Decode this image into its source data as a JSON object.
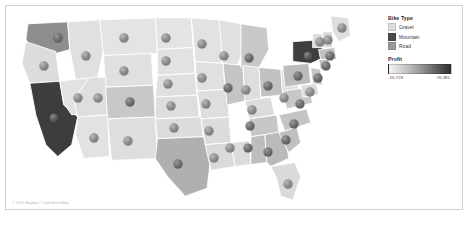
{
  "chart_data": {
    "type": "map",
    "title": "",
    "subtitle": "",
    "map_region": "United States",
    "marker_encoding": "Profit (circle markers per state)",
    "fill_encoding": "Bike Type",
    "legend_position": "top-right",
    "categories": [
      "Gravel",
      "Mountain",
      "Road"
    ],
    "category_colors": [
      "#dcdcdc",
      "#4a4a4a",
      "#9a9a9a"
    ],
    "profit_range": [
      -25729,
      76381
    ],
    "profit_labels": [
      "-25,729",
      "76,381"
    ],
    "states": [
      {
        "name": "Washington",
        "bike_type": "Road",
        "x": 52,
        "y": 32,
        "fill": "#8e8e8e"
      },
      {
        "name": "Oregon",
        "bike_type": "Gravel",
        "x": 38,
        "y": 60,
        "fill": "#dcdcdc"
      },
      {
        "name": "California",
        "bike_type": "Mountain",
        "x": 48,
        "y": 112,
        "fill": "#3d3d3d"
      },
      {
        "name": "Nevada",
        "bike_type": "Gravel",
        "x": 72,
        "y": 92,
        "fill": "#e2e2e2"
      },
      {
        "name": "Idaho",
        "bike_type": "Gravel",
        "x": 80,
        "y": 50,
        "fill": "#e0e0e0"
      },
      {
        "name": "Montana",
        "bike_type": "Gravel",
        "x": 118,
        "y": 32,
        "fill": "#e4e4e4"
      },
      {
        "name": "Wyoming",
        "bike_type": "Gravel",
        "x": 118,
        "y": 65,
        "fill": "#e0e0e0"
      },
      {
        "name": "Utah",
        "bike_type": "Gravel",
        "x": 92,
        "y": 92,
        "fill": "#dedede"
      },
      {
        "name": "Arizona",
        "bike_type": "Gravel",
        "x": 88,
        "y": 132,
        "fill": "#e2e2e2"
      },
      {
        "name": "Colorado",
        "bike_type": "Road",
        "x": 124,
        "y": 96,
        "fill": "#c8c8c8"
      },
      {
        "name": "New Mexico",
        "bike_type": "Gravel",
        "x": 122,
        "y": 135,
        "fill": "#dedede"
      },
      {
        "name": "North Dakota",
        "bike_type": "Gravel",
        "x": 160,
        "y": 32,
        "fill": "#e4e4e4"
      },
      {
        "name": "South Dakota",
        "bike_type": "Gravel",
        "x": 160,
        "y": 55,
        "fill": "#e2e2e2"
      },
      {
        "name": "Nebraska",
        "bike_type": "Gravel",
        "x": 162,
        "y": 78,
        "fill": "#e0e0e0"
      },
      {
        "name": "Kansas",
        "bike_type": "Gravel",
        "x": 165,
        "y": 100,
        "fill": "#dedede"
      },
      {
        "name": "Oklahoma",
        "bike_type": "Gravel",
        "x": 168,
        "y": 122,
        "fill": "#dcdcdc"
      },
      {
        "name": "Texas",
        "bike_type": "Road",
        "x": 172,
        "y": 158,
        "fill": "#b0b0b0"
      },
      {
        "name": "Minnesota",
        "bike_type": "Gravel",
        "x": 196,
        "y": 38,
        "fill": "#e2e2e2"
      },
      {
        "name": "Iowa",
        "bike_type": "Gravel",
        "x": 196,
        "y": 72,
        "fill": "#e0e0e0"
      },
      {
        "name": "Missouri",
        "bike_type": "Gravel",
        "x": 200,
        "y": 98,
        "fill": "#dedede"
      },
      {
        "name": "Arkansas",
        "bike_type": "Gravel",
        "x": 203,
        "y": 125,
        "fill": "#dcdcdc"
      },
      {
        "name": "Louisiana",
        "bike_type": "Gravel",
        "x": 208,
        "y": 152,
        "fill": "#dadada"
      },
      {
        "name": "Wisconsin",
        "bike_type": "Gravel",
        "x": 218,
        "y": 50,
        "fill": "#e0e0e0"
      },
      {
        "name": "Illinois",
        "bike_type": "Road",
        "x": 222,
        "y": 82,
        "fill": "#c4c4c4"
      },
      {
        "name": "Mississippi",
        "bike_type": "Gravel",
        "x": 224,
        "y": 142,
        "fill": "#dcdcdc"
      },
      {
        "name": "Michigan",
        "bike_type": "Road",
        "x": 243,
        "y": 52,
        "fill": "#c8c8c8"
      },
      {
        "name": "Indiana",
        "bike_type": "Gravel",
        "x": 240,
        "y": 84,
        "fill": "#dedede"
      },
      {
        "name": "Kentucky",
        "bike_type": "Gravel",
        "x": 246,
        "y": 104,
        "fill": "#dcdcdc"
      },
      {
        "name": "Tennessee",
        "bike_type": "Road",
        "x": 244,
        "y": 120,
        "fill": "#c6c6c6"
      },
      {
        "name": "Alabama",
        "bike_type": "Road",
        "x": 242,
        "y": 142,
        "fill": "#bdbdbd"
      },
      {
        "name": "Ohio",
        "bike_type": "Road",
        "x": 262,
        "y": 80,
        "fill": "#c2c2c2"
      },
      {
        "name": "Georgia",
        "bike_type": "Road",
        "x": 262,
        "y": 146,
        "fill": "#bababa"
      },
      {
        "name": "Florida",
        "bike_type": "Gravel",
        "x": 282,
        "y": 178,
        "fill": "#dadada"
      },
      {
        "name": "West Virginia",
        "bike_type": "Gravel",
        "x": 278,
        "y": 92,
        "fill": "#dedede"
      },
      {
        "name": "South Carolina",
        "bike_type": "Road",
        "x": 280,
        "y": 134,
        "fill": "#c0c0c0"
      },
      {
        "name": "North Carolina",
        "bike_type": "Road",
        "x": 288,
        "y": 118,
        "fill": "#c4c4c4"
      },
      {
        "name": "Virginia",
        "bike_type": "Road",
        "x": 294,
        "y": 98,
        "fill": "#c8c8c8"
      },
      {
        "name": "Pennsylvania",
        "bike_type": "Road",
        "x": 292,
        "y": 70,
        "fill": "#bcbcbc"
      },
      {
        "name": "New York",
        "bike_type": "Mountain",
        "x": 302,
        "y": 50,
        "fill": "#3f3f3f"
      },
      {
        "name": "Maryland",
        "bike_type": "Gravel",
        "x": 304,
        "y": 86,
        "fill": "#dcdcdc"
      },
      {
        "name": "New Jersey",
        "bike_type": "Road",
        "x": 312,
        "y": 72,
        "fill": "#c6c6c6"
      },
      {
        "name": "Connecticut",
        "bike_type": "Road",
        "x": 320,
        "y": 60,
        "fill": "#c4c4c4"
      },
      {
        "name": "Massachusetts",
        "bike_type": "Road",
        "x": 324,
        "y": 50,
        "fill": "#c0c0c0"
      },
      {
        "name": "Vermont",
        "bike_type": "Gravel",
        "x": 314,
        "y": 36,
        "fill": "#dcdcdc"
      },
      {
        "name": "New Hampshire",
        "bike_type": "Gravel",
        "x": 322,
        "y": 34,
        "fill": "#dadada"
      },
      {
        "name": "Maine",
        "bike_type": "Gravel",
        "x": 336,
        "y": 22,
        "fill": "#dedede"
      }
    ]
  },
  "legend": {
    "bike_type_title": "Bike Type",
    "items": [
      {
        "label": "Gravel",
        "color": "#dcdcdc"
      },
      {
        "label": "Mountain",
        "color": "#4a4a4a"
      },
      {
        "label": "Road",
        "color": "#9a9a9a"
      }
    ],
    "profit_title": "Profit",
    "profit_min_label": "-25,729",
    "profit_max_label": "76,381"
  },
  "attribution": {
    "text": "© 2021 Mapbox © OpenStreetMap"
  }
}
